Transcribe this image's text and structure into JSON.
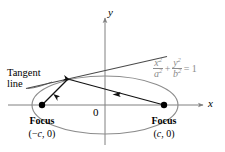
{
  "figure": {
    "background_color": "#ffffff",
    "axes": {
      "x_label": "x",
      "y_label": "y",
      "origin_label": "0",
      "axis_color": "#808080"
    },
    "annotations": {
      "tangent_line_1": "Tangent",
      "tangent_line_2": "line",
      "focus_left_label": "Focus",
      "focus_left_coord_open": "(",
      "focus_left_coord_minus": "−",
      "focus_left_coord_var": "c",
      "focus_left_coord_rest": ", 0)",
      "focus_right_label": "Focus",
      "focus_right_coord_open": "(",
      "focus_right_coord_var": "c",
      "focus_right_coord_rest": ", 0)"
    },
    "equation": {
      "num1": "x",
      "num1_exp": "2",
      "den1": "a",
      "den1_exp": "2",
      "plus": "+",
      "num2": "y",
      "num2_exp": "2",
      "den2": "b",
      "den2_exp": "2",
      "equals": "= 1",
      "color": "#8c8c8c"
    },
    "colors": {
      "curve": "#8c8c8c",
      "ray": "#111111",
      "tangent": "#555555",
      "point": "#000000",
      "text": "#000000"
    },
    "geometry": {
      "ellipse_center_x": 105,
      "ellipse_center_y": 105,
      "ellipse_rx": 73,
      "ellipse_ry": 29,
      "focus_left_x": 42,
      "focus_left_y": 105,
      "focus_right_x": 164,
      "focus_right_y": 105,
      "tangent_point_x": 68,
      "tangent_point_y": 79,
      "tangent_start_x": 27,
      "tangent_start_y": 88,
      "tangent_end_x": 166,
      "tangent_end_y": 57,
      "x_axis_y": 105,
      "y_axis_x": 105
    }
  }
}
